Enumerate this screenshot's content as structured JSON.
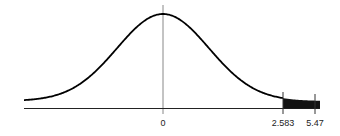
{
  "chart_data": {
    "type": "area",
    "title": "",
    "xlabel": "",
    "ylabel": "",
    "tick_labels": [
      "0",
      "2.583",
      "5.47"
    ],
    "ticks": [
      0,
      2.583,
      5.47
    ],
    "shaded_region": {
      "from": 2.583,
      "to": 5.47
    },
    "grid": false,
    "colors": {
      "curve": "#000000",
      "shade": "#111111",
      "axis": "#222222",
      "center_line": "#888888"
    }
  },
  "labels": {
    "zero": "0",
    "lower": "2.583",
    "upper": "5.47"
  }
}
